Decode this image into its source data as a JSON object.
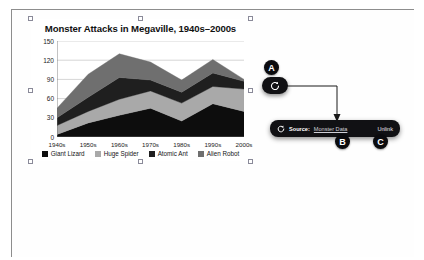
{
  "chart_data": {
    "type": "area",
    "stacked": true,
    "title": "Monster Attacks in Megaville, 1940s–2000s",
    "xlabel": "",
    "ylabel": "",
    "grid": true,
    "legend_position": "bottom",
    "ylim": [
      0,
      150
    ],
    "yticks": [
      0,
      30,
      60,
      90,
      120,
      150
    ],
    "categories": [
      "1940s",
      "1950s",
      "1960s",
      "1970s",
      "1980s",
      "1990s",
      "2000s"
    ],
    "series": [
      {
        "name": "Giant Lizard",
        "color": "#0d0d0d",
        "values": [
          4,
          22,
          34,
          45,
          25,
          52,
          40
        ]
      },
      {
        "name": "Huge Spider",
        "color": "#a9a9a9",
        "values": [
          14,
          18,
          25,
          27,
          28,
          27,
          35
        ]
      },
      {
        "name": "Atomic Ant",
        "color": "#1f1f1f",
        "values": [
          12,
          22,
          34,
          17,
          17,
          21,
          12
        ]
      },
      {
        "name": "Alien Robot",
        "color": "#6f6f6f",
        "values": [
          15,
          36,
          37,
          28,
          19,
          21,
          3
        ]
      }
    ],
    "totals": [
      45,
      98,
      130,
      117,
      89,
      121,
      90
    ]
  },
  "chart_object": {
    "selected": true,
    "handle_count": 8
  },
  "refresh_button": {
    "icon": "refresh-icon",
    "tooltip": ""
  },
  "source_bar": {
    "icon": "refresh-icon",
    "label": "Source:",
    "value": "Monster Data",
    "unlink_label": "Unlink"
  },
  "callouts": {
    "a": "A",
    "b": "B",
    "c": "C"
  }
}
